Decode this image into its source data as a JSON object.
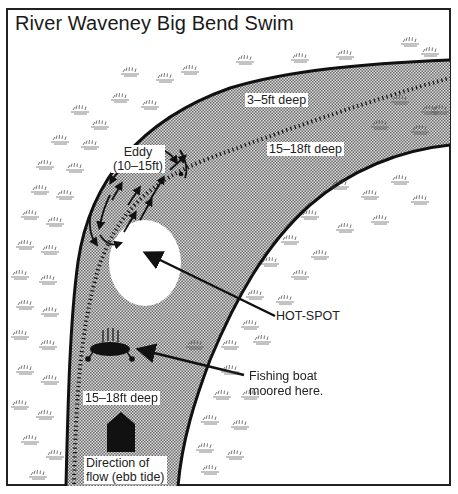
{
  "title": "River Waveney Big Bend Swim",
  "labels": {
    "shallow": "3–5ft deep",
    "deep_upper": "15–18ft deep",
    "eddy_line1": "Eddy",
    "eddy_line2": "(10–15ft)",
    "hotspot": "HOT-SPOT",
    "boat_line1": "Fishing boat",
    "boat_line2": "moored here.",
    "deep_lower": "15–18ft deep",
    "flow_line1": "Direction of",
    "flow_line2": "flow (ebb tide)"
  },
  "colors": {
    "water_dark": "#8a8a8a",
    "water_light": "#d6d6d6",
    "line": "#111111",
    "bank": "#ffffff",
    "hotspot": "#ffffff"
  }
}
